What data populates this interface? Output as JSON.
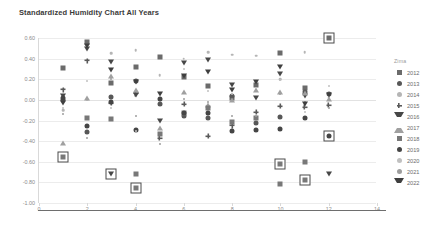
{
  "chart_data": {
    "type": "scatter",
    "title": "Standardized Humidity Chart All Years",
    "xlabel": "",
    "ylabel": "",
    "xlim": [
      0,
      14
    ],
    "ylim": [
      -1.0,
      0.6
    ],
    "xticks": [
      "0",
      "2",
      "4",
      "6",
      "8",
      "10",
      "12",
      "14"
    ],
    "xtick_values": [
      0,
      2,
      4,
      6,
      8,
      10,
      12,
      14
    ],
    "yticks": [
      "0.60",
      "0.40",
      "0.20",
      "0.00",
      "-0.20",
      "-0.40",
      "-0.60",
      "-0.80",
      "-1.00"
    ],
    "ytick_values": [
      0.6,
      0.4,
      0.2,
      0.0,
      -0.2,
      -0.4,
      -0.6,
      -0.8,
      -1.0
    ],
    "grid": true,
    "legend_position": "right",
    "legend_title": "Zima",
    "series": [
      {
        "name": "2012",
        "marker": "square",
        "color": "#6b6b6b",
        "points": [
          [
            1,
            0.31
          ],
          [
            2,
            0.56
          ],
          [
            3,
            0.16
          ],
          [
            4,
            0.32
          ],
          [
            5,
            0.42
          ],
          [
            6,
            0.22
          ],
          [
            7,
            0.13
          ],
          [
            8,
            0.02
          ],
          [
            9,
            0.14
          ],
          [
            10,
            0.45
          ],
          [
            11,
            0.12
          ],
          [
            12,
            0.6
          ]
        ]
      },
      {
        "name": "2013",
        "marker": "circle",
        "color": "#575757",
        "points": [
          [
            1,
            0.0
          ],
          [
            2,
            -0.31
          ],
          [
            3,
            0.03
          ],
          [
            4,
            0.18
          ],
          [
            5,
            -0.04
          ],
          [
            6,
            -0.16
          ],
          [
            7,
            -0.18
          ],
          [
            8,
            0.04
          ],
          [
            9,
            -0.22
          ],
          [
            10,
            -0.17
          ],
          [
            11,
            0.08
          ],
          [
            12,
            0.06
          ]
        ]
      },
      {
        "name": "2014",
        "marker": "dot",
        "color": "#b5b5b5",
        "points": [
          [
            1,
            -0.1
          ],
          [
            2,
            0.0
          ],
          [
            3,
            0.45
          ],
          [
            4,
            0.48
          ],
          [
            5,
            0.24
          ],
          [
            6,
            0.4
          ],
          [
            7,
            0.46
          ],
          [
            8,
            0.44
          ],
          [
            9,
            0.43
          ],
          [
            10,
            0.2
          ],
          [
            11,
            0.46
          ],
          [
            12,
            0.02
          ]
        ]
      },
      {
        "name": "2015",
        "marker": "plus",
        "color": "#5a5a5a",
        "points": [
          [
            1,
            0.1
          ],
          [
            2,
            0.38
          ],
          [
            3,
            -0.03
          ],
          [
            4,
            0.06
          ],
          [
            5,
            -0.37
          ],
          [
            6,
            -0.04
          ],
          [
            7,
            -0.35
          ],
          [
            8,
            -0.25
          ],
          [
            9,
            -0.12
          ],
          [
            10,
            -0.06
          ],
          [
            11,
            -0.07
          ],
          [
            12,
            -0.05
          ]
        ]
      },
      {
        "name": "2016",
        "marker": "tri-down",
        "color": "#474747",
        "points": [
          [
            1,
            0.04
          ],
          [
            2,
            0.49
          ],
          [
            3,
            0.37
          ],
          [
            4,
            0.05
          ],
          [
            5,
            -0.2
          ],
          [
            6,
            0.36
          ],
          [
            7,
            0.39
          ],
          [
            8,
            0.14
          ],
          [
            9,
            0.02
          ],
          [
            10,
            0.25
          ],
          [
            11,
            0.04
          ],
          [
            12,
            -0.72
          ]
        ]
      },
      {
        "name": "2017",
        "marker": "tri-up",
        "color": "#a0a0a0",
        "points": [
          [
            1,
            -0.42
          ],
          [
            2,
            0.02
          ],
          [
            3,
            0.23
          ],
          [
            4,
            0.1
          ],
          [
            5,
            -0.27
          ],
          [
            6,
            0.08
          ],
          [
            7,
            -0.05
          ],
          [
            8,
            0.0
          ],
          [
            9,
            0.1
          ],
          [
            10,
            0.08
          ],
          [
            11,
            0.07
          ],
          [
            12,
            0.01
          ]
        ]
      },
      {
        "name": "2018",
        "marker": "square",
        "color": "#787878",
        "points": [
          [
            1,
            -0.55
          ],
          [
            2,
            -0.18
          ],
          [
            3,
            -0.19
          ],
          [
            4,
            -0.72
          ],
          [
            5,
            -0.33
          ],
          [
            6,
            -0.13
          ],
          [
            7,
            -0.08
          ],
          [
            8,
            -0.21
          ],
          [
            9,
            -0.18
          ],
          [
            10,
            -0.82
          ],
          [
            11,
            -0.6
          ],
          [
            12,
            -0.35
          ]
        ]
      },
      {
        "name": "2019",
        "marker": "circle",
        "color": "#454545",
        "points": [
          [
            1,
            0.02
          ],
          [
            2,
            -0.25
          ],
          [
            3,
            -0.02
          ],
          [
            4,
            -0.29
          ],
          [
            5,
            0.01
          ],
          [
            6,
            -0.13
          ],
          [
            7,
            -0.13
          ],
          [
            8,
            -0.3
          ],
          [
            9,
            -0.29
          ],
          [
            10,
            -0.28
          ],
          [
            11,
            -0.18
          ],
          [
            12,
            -0.35
          ]
        ]
      },
      {
        "name": "2020",
        "marker": "smalldot",
        "color": "#c0c0c0",
        "points": [
          [
            1,
            -0.08
          ],
          [
            2,
            0.18
          ],
          [
            3,
            -0.08
          ],
          [
            4,
            -0.3
          ],
          [
            5,
            0.07
          ],
          [
            6,
            0.3
          ],
          [
            7,
            0.09
          ],
          [
            8,
            0.06
          ],
          [
            9,
            0.12
          ],
          [
            10,
            0.19
          ],
          [
            11,
            -0.12
          ],
          [
            12,
            0.13
          ]
        ]
      },
      {
        "name": "2021",
        "marker": "smalldot",
        "color": "#9e9e9e",
        "points": [
          [
            1,
            -0.14
          ],
          [
            2,
            -0.37
          ],
          [
            3,
            0.2
          ],
          [
            4,
            -0.16
          ],
          [
            5,
            -0.43
          ],
          [
            6,
            0.01
          ],
          [
            7,
            -0.02
          ],
          [
            8,
            -0.16
          ],
          [
            9,
            -0.16
          ],
          [
            10,
            0.06
          ],
          [
            11,
            -0.02
          ],
          [
            12,
            -0.08
          ]
        ]
      },
      {
        "name": "2022",
        "marker": "tri-down",
        "color": "#3f3f3f",
        "points": [
          [
            1,
            -0.03
          ],
          [
            2,
            0.52
          ],
          [
            3,
            0.29
          ],
          [
            4,
            0.17
          ],
          [
            5,
            0.06
          ],
          [
            6,
            0.23
          ],
          [
            7,
            0.27
          ],
          [
            8,
            0.1
          ],
          [
            9,
            0.17
          ],
          [
            10,
            0.32
          ],
          [
            11,
            -0.04
          ],
          [
            12,
            0.05
          ]
        ]
      }
    ],
    "highlights": [
      {
        "x": 1,
        "y": -0.55,
        "label": "2018"
      },
      {
        "x": 3,
        "y": -0.72,
        "label": "2016"
      },
      {
        "x": 4,
        "y": -0.85,
        "label": "2018"
      },
      {
        "x": 10,
        "y": -0.62,
        "label": "2018"
      },
      {
        "x": 11,
        "y": -0.78,
        "label": "2018"
      },
      {
        "x": 12,
        "y": 0.6,
        "label": "2012"
      },
      {
        "x": 12,
        "y": -0.35,
        "label": "2019"
      }
    ]
  }
}
